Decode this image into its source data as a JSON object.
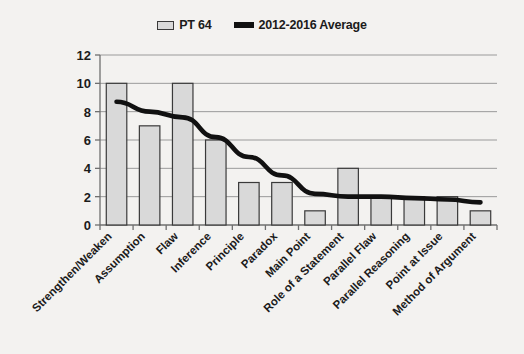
{
  "chart_data": {
    "type": "bar",
    "title": "",
    "xlabel": "",
    "ylabel": "",
    "ylim": [
      0,
      12
    ],
    "ytick_step": 2,
    "yticks": [
      0,
      2,
      4,
      6,
      8,
      10,
      12
    ],
    "grid": true,
    "legend_position": "top-center",
    "categories": [
      "Strengthen/Weaken",
      "Assumption",
      "Flaw",
      "Inference",
      "Principle",
      "Paradox",
      "Main Point",
      "Role of a Statement",
      "Parallel Flaw",
      "Parallel Reasoning",
      "Point at Issue",
      "Method of Argument"
    ],
    "series": [
      {
        "name": "PT 64",
        "type": "bar",
        "values": [
          10,
          7,
          10,
          6,
          3,
          3,
          1,
          4,
          2,
          2,
          2,
          1
        ]
      },
      {
        "name": "2012-2016 Average",
        "type": "line",
        "values": [
          8.7,
          8.0,
          7.6,
          6.2,
          4.8,
          3.5,
          2.2,
          2.0,
          2.0,
          1.9,
          1.8,
          1.6
        ]
      }
    ]
  },
  "legend": {
    "items": [
      {
        "label": "PT 64",
        "marker": "bar-swatch-icon",
        "color": "#d9d9d9"
      },
      {
        "label": "2012-2016 Average",
        "marker": "line-swatch-icon",
        "color": "#111111"
      }
    ]
  },
  "axis": {
    "y_tick_labels": [
      "12",
      "10",
      "8",
      "6",
      "4",
      "2",
      "0"
    ]
  },
  "colors": {
    "background": "#f3f2f0",
    "bar_fill": "#d9d9d9",
    "bar_stroke": "#3a3a3a",
    "line": "#111111",
    "gridline": "#9a9a9a",
    "axis": "#6f6f6f",
    "text": "#1b1b1b"
  }
}
